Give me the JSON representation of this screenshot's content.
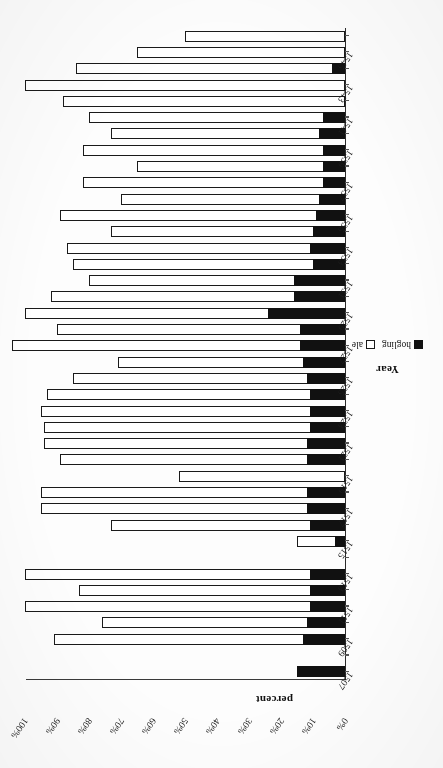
{
  "chart_data": {
    "type": "bar",
    "subtype": "stacked-horizontal-100",
    "title": "",
    "xlabel": "Year",
    "ylabel": "percent",
    "ylim": [
      0,
      100
    ],
    "ytick_labels": [
      "100%",
      "90%",
      "80%",
      "70%",
      "60%",
      "50%",
      "40%",
      "30%",
      "20%",
      "10%",
      "0%"
    ],
    "ytick_values": [
      100,
      90,
      80,
      70,
      60,
      50,
      40,
      30,
      20,
      10,
      0
    ],
    "grid": false,
    "legend_position": "bottom-right",
    "legend": [
      "hogling",
      "ale"
    ],
    "categories": [
      "1507",
      "1508",
      "1509",
      "1510",
      "1511",
      "1512",
      "1513",
      "1514",
      "1515",
      "1516",
      "1517",
      "1518",
      "1519",
      "1520",
      "1521",
      "1522",
      "1523",
      "1524",
      "1525",
      "1526",
      "1527",
      "1528",
      "1529",
      "1530",
      "1531",
      "1532",
      "1533",
      "1534",
      "1535",
      "1536",
      "1537",
      "1538",
      "1539",
      "1540",
      "1541",
      "1542",
      "1543",
      "1544",
      "1545",
      "1546"
    ],
    "tick_label_categories": [
      "1507",
      "1509",
      "1511",
      "1513",
      "1515",
      "1517",
      "1519",
      "1521",
      "1523",
      "1525",
      "1527",
      "1529",
      "1531",
      "1533",
      "1535",
      "1537",
      "1539",
      "1541",
      "1543",
      "1545"
    ],
    "series": [
      {
        "name": "hogling",
        "color": "#111111",
        "values": [
          15,
          0,
          13,
          12,
          11,
          11,
          11,
          0,
          3,
          11,
          12,
          12,
          0,
          12,
          12,
          11,
          11,
          11,
          12,
          13,
          14,
          14,
          24,
          16,
          16,
          10,
          11,
          10,
          9,
          8,
          7,
          7,
          7,
          8,
          7,
          0,
          0,
          4,
          0,
          0
        ]
      },
      {
        "name": "ale",
        "color": "#ffffff",
        "values": [
          0,
          0,
          78,
          64,
          89,
          72,
          89,
          0,
          12,
          62,
          83,
          83,
          52,
          77,
          82,
          83,
          84,
          82,
          73,
          58,
          90,
          76,
          76,
          76,
          64,
          75,
          76,
          63,
          80,
          62,
          75,
          58,
          75,
          65,
          73,
          88,
          100,
          80,
          65,
          50
        ]
      }
    ]
  },
  "axes": {
    "value_axis_title": "percent",
    "category_axis_title": "Year"
  },
  "legend": {
    "items": [
      {
        "label": "hogling",
        "marker": "filled-square",
        "color": "#111111"
      },
      {
        "label": "ale",
        "marker": "hollow-square",
        "color": "#ffffff"
      }
    ]
  }
}
